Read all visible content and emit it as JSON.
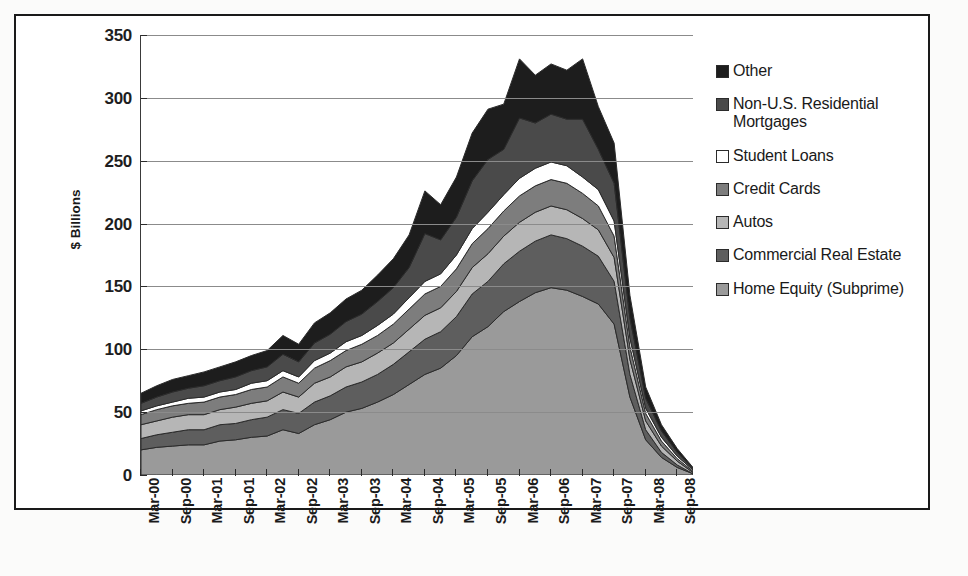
{
  "chart_data": {
    "type": "area",
    "stacked": true,
    "title": "",
    "xlabel": "",
    "ylabel": "$ Billions",
    "ylim": [
      0,
      350
    ],
    "yticks": [
      0,
      50,
      100,
      150,
      200,
      250,
      300,
      350
    ],
    "grid": true,
    "legend_position": "right",
    "categories": [
      "Mar-00",
      "Jun-00",
      "Sep-00",
      "Dec-00",
      "Mar-01",
      "Jun-01",
      "Sep-01",
      "Dec-01",
      "Mar-02",
      "Jun-02",
      "Sep-02",
      "Dec-02",
      "Mar-03",
      "Jun-03",
      "Sep-03",
      "Dec-03",
      "Mar-04",
      "Jun-04",
      "Sep-04",
      "Dec-04",
      "Mar-05",
      "Jun-05",
      "Sep-05",
      "Dec-05",
      "Mar-06",
      "Jun-06",
      "Sep-06",
      "Dec-06",
      "Mar-07",
      "Jun-07",
      "Sep-07",
      "Dec-07",
      "Mar-08",
      "Jun-08",
      "Sep-08",
      "Dec-08"
    ],
    "tick_labels": [
      "Mar-00",
      "Sep-00",
      "Mar-01",
      "Sep-01",
      "Mar-02",
      "Sep-02",
      "Mar-03",
      "Sep-03",
      "Mar-04",
      "Sep-04",
      "Mar-05",
      "Sep-05",
      "Mar-06",
      "Sep-06",
      "Mar-07",
      "Sep-07",
      "Mar-08",
      "Sep-08"
    ],
    "series": [
      {
        "name": "Home Equity (Subprime)",
        "color": "#9a9a9a",
        "values": [
          20,
          22,
          23,
          24,
          24,
          27,
          28,
          30,
          31,
          36,
          33,
          40,
          44,
          50,
          53,
          58,
          64,
          72,
          80,
          85,
          95,
          110,
          118,
          130,
          138,
          145,
          149,
          147,
          142,
          136,
          120,
          62,
          28,
          14,
          6,
          1
        ]
      },
      {
        "name": "Commercial Real Estate",
        "color": "#5e5e5e",
        "values": [
          9,
          10,
          11,
          12,
          12,
          13,
          13,
          14,
          15,
          16,
          16,
          18,
          19,
          20,
          21,
          22,
          24,
          26,
          28,
          29,
          31,
          34,
          36,
          38,
          40,
          41,
          42,
          41,
          40,
          38,
          34,
          18,
          8,
          4,
          2,
          0
        ]
      },
      {
        "name": "Autos",
        "color": "#b6b6b6",
        "values": [
          11,
          11,
          12,
          12,
          12,
          12,
          13,
          13,
          13,
          14,
          13,
          15,
          15,
          16,
          16,
          17,
          17,
          18,
          19,
          19,
          20,
          21,
          22,
          22,
          23,
          23,
          23,
          23,
          22,
          21,
          19,
          12,
          7,
          5,
          3,
          1
        ]
      },
      {
        "name": "Credit Cards",
        "color": "#7d7d7d",
        "values": [
          8,
          9,
          9,
          9,
          10,
          10,
          10,
          11,
          11,
          12,
          11,
          12,
          13,
          13,
          14,
          14,
          15,
          16,
          17,
          17,
          18,
          19,
          20,
          20,
          21,
          21,
          21,
          21,
          20,
          19,
          17,
          10,
          6,
          4,
          2,
          1
        ]
      },
      {
        "name": "Student Loans",
        "color": "#ffffff",
        "values": [
          3,
          3,
          3,
          4,
          4,
          4,
          4,
          5,
          5,
          5,
          5,
          6,
          6,
          7,
          7,
          8,
          8,
          9,
          10,
          10,
          11,
          12,
          13,
          13,
          14,
          14,
          14,
          14,
          13,
          13,
          12,
          7,
          4,
          3,
          2,
          1
        ]
      },
      {
        "name": "Non-U.S. Residential Mortgages",
        "color": "#4a4a4a",
        "values": [
          6,
          7,
          8,
          8,
          9,
          9,
          10,
          10,
          11,
          13,
          12,
          14,
          15,
          16,
          17,
          19,
          21,
          24,
          38,
          27,
          30,
          38,
          42,
          36,
          48,
          36,
          38,
          37,
          46,
          32,
          30,
          16,
          8,
          5,
          3,
          1
        ]
      },
      {
        "name": "Other",
        "color": "#1d1d1d",
        "values": [
          8,
          9,
          10,
          10,
          11,
          11,
          12,
          12,
          13,
          15,
          14,
          16,
          17,
          18,
          19,
          21,
          23,
          26,
          34,
          28,
          32,
          38,
          40,
          36,
          47,
          38,
          40,
          39,
          48,
          34,
          32,
          18,
          9,
          5,
          3,
          1
        ]
      }
    ]
  },
  "legend": {
    "items": [
      {
        "label": "Other",
        "color": "#1d1d1d"
      },
      {
        "label": "Non-U.S. Residential Mortgages",
        "color": "#4a4a4a"
      },
      {
        "label": "Student Loans",
        "color": "#ffffff"
      },
      {
        "label": "Credit Cards",
        "color": "#7d7d7d"
      },
      {
        "label": "Autos",
        "color": "#b6b6b6"
      },
      {
        "label": "Commercial Real Estate",
        "color": "#5e5e5e"
      },
      {
        "label": "Home Equity (Subprime)",
        "color": "#9a9a9a"
      }
    ]
  },
  "axis": {
    "y_title": "$ Billions"
  }
}
